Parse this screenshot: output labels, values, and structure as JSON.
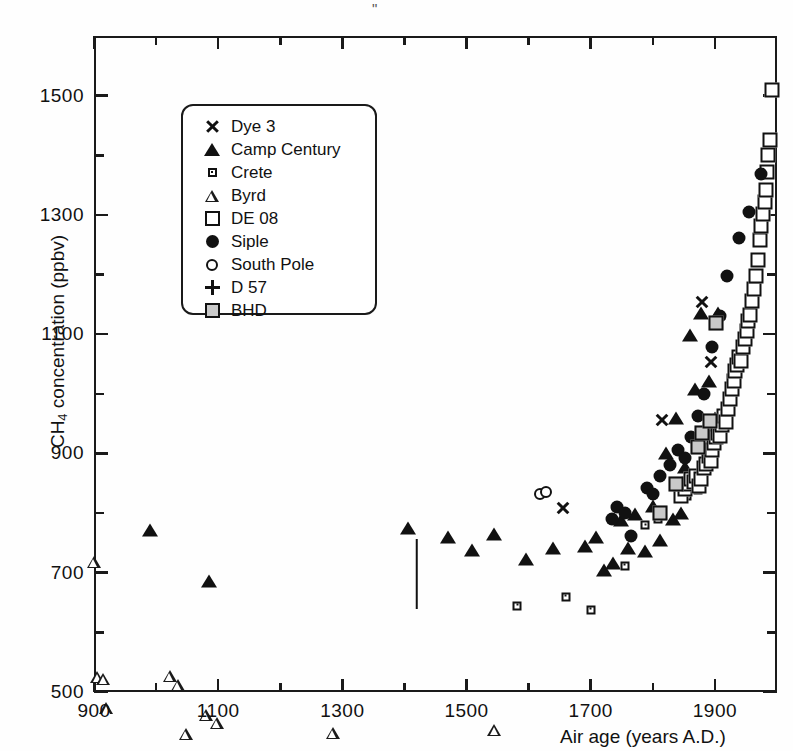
{
  "chart_data": {
    "type": "scatter",
    "title": "",
    "xlabel": "Air age  (years A.D.)",
    "ylabel_html": "CH<sub>4</sub> concentration (ppbv)",
    "ylabel": "CH4 concentration (ppbv)",
    "xlim": [
      900,
      2000
    ],
    "ylim": [
      500,
      1600
    ],
    "xticks": [
      900,
      1100,
      1300,
      1500,
      1700,
      1900
    ],
    "xticks_minor": [
      1000,
      1200,
      1400,
      1600,
      1800,
      2000
    ],
    "yticks": [
      500,
      700,
      900,
      1100,
      1300,
      1500
    ],
    "yticks_minor": [
      600,
      800,
      1000,
      1200,
      1400,
      1600
    ],
    "grid": false,
    "legend_position": "upper-left-inset",
    "legend": [
      "Dye 3",
      "Camp Century",
      "Crete",
      "Byrd",
      "DE  08",
      "Siple",
      "South Pole",
      "D 57",
      "BHD"
    ],
    "annotations": [
      {
        "type": "errorbar",
        "x": 1420,
        "y": 698,
        "yerr": 58,
        "series": "D 57"
      }
    ],
    "series": [
      {
        "name": "Dye 3",
        "marker": "x",
        "points": [
          [
            1655,
            808
          ],
          [
            1815,
            978
          ],
          [
            1880,
            1198
          ],
          [
            1893,
            1118
          ]
        ]
      },
      {
        "name": "Camp Century",
        "marker": "filled-triangle",
        "points": [
          [
            990,
            772
          ],
          [
            1085,
            686
          ],
          [
            1405,
            775
          ],
          [
            1470,
            760
          ],
          [
            1508,
            738
          ],
          [
            1545,
            765
          ],
          [
            1595,
            723
          ],
          [
            1640,
            742
          ],
          [
            1690,
            745
          ],
          [
            1708,
            760
          ],
          [
            1722,
            705
          ],
          [
            1736,
            716
          ],
          [
            1748,
            788
          ],
          [
            1760,
            742
          ],
          [
            1772,
            798
          ],
          [
            1788,
            737
          ],
          [
            1800,
            812
          ],
          [
            1812,
            755
          ],
          [
            1822,
            900
          ],
          [
            1832,
            790
          ],
          [
            1838,
            960
          ],
          [
            1845,
            800
          ],
          [
            1852,
            878
          ],
          [
            1860,
            1098
          ],
          [
            1868,
            1008
          ],
          [
            1878,
            1135
          ],
          [
            1890,
            1022
          ],
          [
            1900,
            960
          ],
          [
            1905,
            1135
          ]
        ]
      },
      {
        "name": "Crete",
        "marker": "dotted-square",
        "points": [
          [
            1582,
            645
          ],
          [
            1660,
            660
          ],
          [
            1700,
            638
          ],
          [
            1755,
            712
          ],
          [
            1788,
            780
          ],
          [
            1808,
            790
          ],
          [
            1855,
            828
          ],
          [
            1872,
            838
          ],
          [
            1885,
            905
          ],
          [
            1898,
            935
          ]
        ]
      },
      {
        "name": "Byrd",
        "marker": "open-triangle",
        "points": [
          [
            900,
            805
          ],
          [
            905,
            632
          ],
          [
            915,
            650
          ],
          [
            920,
            620
          ],
          [
            1022,
            695
          ],
          [
            1035,
            700
          ],
          [
            1048,
            638
          ],
          [
            1080,
            690
          ],
          [
            1098,
            697
          ],
          [
            1285,
            700
          ],
          [
            1352,
            635
          ],
          [
            1420,
            698
          ],
          [
            1472,
            692
          ],
          [
            1500,
            660
          ],
          [
            1545,
            805
          ],
          [
            1560,
            700
          ],
          [
            1572,
            672
          ],
          [
            1608,
            648
          ],
          [
            1640,
            690
          ],
          [
            1650,
            662
          ],
          [
            1660,
            628
          ],
          [
            1700,
            600
          ],
          [
            1742,
            682
          ],
          [
            1760,
            650
          ],
          [
            1790,
            640
          ],
          [
            1838,
            672
          ],
          [
            1858,
            688
          ]
        ]
      },
      {
        "name": "DE  08",
        "marker": "open-square",
        "points": [
          [
            1845,
            828
          ],
          [
            1852,
            840
          ],
          [
            1858,
            848
          ],
          [
            1862,
            858
          ],
          [
            1866,
            852
          ],
          [
            1870,
            862
          ],
          [
            1874,
            845
          ],
          [
            1878,
            858
          ],
          [
            1882,
            875
          ],
          [
            1886,
            882
          ],
          [
            1890,
            895
          ],
          [
            1893,
            888
          ],
          [
            1896,
            905
          ],
          [
            1899,
            918
          ],
          [
            1902,
            928
          ],
          [
            1905,
            935
          ],
          [
            1908,
            930
          ],
          [
            1911,
            948
          ],
          [
            1914,
            962
          ],
          [
            1918,
            952
          ],
          [
            1921,
            975
          ],
          [
            1924,
            992
          ],
          [
            1927,
            1008
          ],
          [
            1930,
            1022
          ],
          [
            1933,
            1038
          ],
          [
            1936,
            1048
          ],
          [
            1939,
            1062
          ],
          [
            1942,
            1055
          ],
          [
            1945,
            1078
          ],
          [
            1948,
            1092
          ],
          [
            1951,
            1105
          ],
          [
            1954,
            1122
          ],
          [
            1957,
            1132
          ],
          [
            1960,
            1155
          ],
          [
            1963,
            1175
          ],
          [
            1966,
            1198
          ],
          [
            1969,
            1225
          ],
          [
            1972,
            1258
          ],
          [
            1975,
            1282
          ],
          [
            1978,
            1302
          ],
          [
            1980,
            1322
          ],
          [
            1982,
            1342
          ],
          [
            1984,
            1372
          ],
          [
            1986,
            1400
          ],
          [
            1988,
            1425
          ],
          [
            1992,
            1510
          ]
        ]
      },
      {
        "name": "Siple",
        "marker": "filled-circle",
        "points": [
          [
            1735,
            790
          ],
          [
            1742,
            810
          ],
          [
            1755,
            800
          ],
          [
            1765,
            762
          ],
          [
            1790,
            842
          ],
          [
            1800,
            832
          ],
          [
            1812,
            862
          ],
          [
            1828,
            880
          ],
          [
            1840,
            905
          ],
          [
            1852,
            892
          ],
          [
            1862,
            928
          ],
          [
            1872,
            962
          ],
          [
            1882,
            1000
          ],
          [
            1895,
            1078
          ],
          [
            1908,
            1130
          ],
          [
            1920,
            1198
          ],
          [
            1938,
            1262
          ],
          [
            1955,
            1305
          ],
          [
            1975,
            1368
          ]
        ]
      },
      {
        "name": "South Pole",
        "marker": "open-circle",
        "points": [
          [
            1618,
            832
          ],
          [
            1628,
            835
          ]
        ]
      },
      {
        "name": "D 57",
        "marker": "plus",
        "points": [
          [
            1420,
            698
          ]
        ]
      },
      {
        "name": "BHD",
        "marker": "shaded-square",
        "points": [
          [
            1812,
            800
          ],
          [
            1838,
            848
          ],
          [
            1872,
            910
          ],
          [
            1880,
            935
          ],
          [
            1892,
            955
          ],
          [
            1902,
            1118
          ]
        ]
      }
    ]
  },
  "axes": {
    "x_tick_labels": [
      "900",
      "1100",
      "1300",
      "1500",
      "1700",
      "1900"
    ],
    "y_tick_labels": [
      "500",
      "700",
      "900",
      "1100",
      "1300",
      "1500"
    ],
    "x_title": "Air age  (years A.D.)",
    "y_title_prefix": "CH",
    "y_title_sub": "4",
    "y_title_suffix": " concentration (ppbv)"
  },
  "legend": {
    "items": [
      {
        "label": "Dye 3",
        "icon": "x-marker-icon"
      },
      {
        "label": "Camp Century",
        "icon": "filled-triangle-icon"
      },
      {
        "label": "Crete",
        "icon": "dotted-square-icon"
      },
      {
        "label": "Byrd",
        "icon": "open-triangle-icon"
      },
      {
        "label": "DE  08",
        "icon": "open-square-icon"
      },
      {
        "label": "Siple",
        "icon": "filled-circle-icon"
      },
      {
        "label": "South Pole",
        "icon": "open-circle-icon"
      },
      {
        "label": "D 57",
        "icon": "plus-marker-icon"
      },
      {
        "label": "BHD",
        "icon": "shaded-square-icon"
      }
    ]
  },
  "artifacts": {
    "top_speck": "\""
  },
  "colors": {
    "ink": "#1a1a1a",
    "paper": "#fefefe",
    "shaded_fill": "#c9c9c9"
  }
}
